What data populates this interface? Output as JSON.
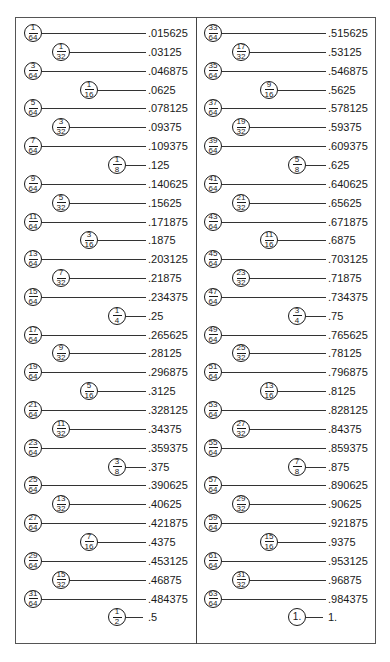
{
  "columns": [
    {
      "rows": [
        {
          "num": "1",
          "den": "64",
          "level": 64,
          "decimal": ".015625"
        },
        {
          "num": "1",
          "den": "32",
          "level": 32,
          "decimal": ".03125"
        },
        {
          "num": "3",
          "den": "64",
          "level": 64,
          "decimal": ".046875"
        },
        {
          "num": "1",
          "den": "16",
          "level": 16,
          "decimal": ".0625"
        },
        {
          "num": "5",
          "den": "64",
          "level": 64,
          "decimal": ".078125"
        },
        {
          "num": "3",
          "den": "32",
          "level": 32,
          "decimal": ".09375"
        },
        {
          "num": "7",
          "den": "64",
          "level": 64,
          "decimal": ".109375"
        },
        {
          "num": "1",
          "den": "8",
          "level": 8,
          "decimal": ".125"
        },
        {
          "num": "9",
          "den": "64",
          "level": 64,
          "decimal": ".140625"
        },
        {
          "num": "5",
          "den": "32",
          "level": 32,
          "decimal": ".15625"
        },
        {
          "num": "11",
          "den": "64",
          "level": 64,
          "decimal": ".171875"
        },
        {
          "num": "3",
          "den": "16",
          "level": 16,
          "decimal": ".1875"
        },
        {
          "num": "13",
          "den": "64",
          "level": 64,
          "decimal": ".203125"
        },
        {
          "num": "7",
          "den": "32",
          "level": 32,
          "decimal": ".21875"
        },
        {
          "num": "15",
          "den": "64",
          "level": 64,
          "decimal": ".234375"
        },
        {
          "num": "1",
          "den": "4",
          "level": 4,
          "decimal": ".25"
        },
        {
          "num": "17",
          "den": "64",
          "level": 64,
          "decimal": ".265625"
        },
        {
          "num": "9",
          "den": "32",
          "level": 32,
          "decimal": ".28125"
        },
        {
          "num": "19",
          "den": "64",
          "level": 64,
          "decimal": ".296875"
        },
        {
          "num": "5",
          "den": "16",
          "level": 16,
          "decimal": ".3125"
        },
        {
          "num": "21",
          "den": "64",
          "level": 64,
          "decimal": ".328125"
        },
        {
          "num": "11",
          "den": "32",
          "level": 32,
          "decimal": ".34375"
        },
        {
          "num": "23",
          "den": "64",
          "level": 64,
          "decimal": ".359375"
        },
        {
          "num": "3",
          "den": "8",
          "level": 8,
          "decimal": ".375"
        },
        {
          "num": "25",
          "den": "64",
          "level": 64,
          "decimal": ".390625"
        },
        {
          "num": "13",
          "den": "32",
          "level": 32,
          "decimal": ".40625"
        },
        {
          "num": "27",
          "den": "64",
          "level": 64,
          "decimal": ".421875"
        },
        {
          "num": "7",
          "den": "16",
          "level": 16,
          "decimal": ".4375"
        },
        {
          "num": "29",
          "den": "64",
          "level": 64,
          "decimal": ".453125"
        },
        {
          "num": "15",
          "den": "32",
          "level": 32,
          "decimal": ".46875"
        },
        {
          "num": "31",
          "den": "64",
          "level": 64,
          "decimal": ".484375"
        },
        {
          "num": "1",
          "den": "2",
          "level": 2,
          "decimal": ".5"
        }
      ]
    },
    {
      "rows": [
        {
          "num": "33",
          "den": "64",
          "level": 64,
          "decimal": ".515625"
        },
        {
          "num": "17",
          "den": "32",
          "level": 32,
          "decimal": ".53125"
        },
        {
          "num": "35",
          "den": "64",
          "level": 64,
          "decimal": ".546875"
        },
        {
          "num": "9",
          "den": "16",
          "level": 16,
          "decimal": ".5625"
        },
        {
          "num": "37",
          "den": "64",
          "level": 64,
          "decimal": ".578125"
        },
        {
          "num": "19",
          "den": "32",
          "level": 32,
          "decimal": ".59375"
        },
        {
          "num": "39",
          "den": "64",
          "level": 64,
          "decimal": ".609375"
        },
        {
          "num": "5",
          "den": "8",
          "level": 8,
          "decimal": ".625"
        },
        {
          "num": "41",
          "den": "64",
          "level": 64,
          "decimal": ".640625"
        },
        {
          "num": "21",
          "den": "32",
          "level": 32,
          "decimal": ".65625"
        },
        {
          "num": "43",
          "den": "64",
          "level": 64,
          "decimal": ".671875"
        },
        {
          "num": "11",
          "den": "16",
          "level": 16,
          "decimal": ".6875"
        },
        {
          "num": "45",
          "den": "64",
          "level": 64,
          "decimal": ".703125"
        },
        {
          "num": "23",
          "den": "32",
          "level": 32,
          "decimal": ".71875"
        },
        {
          "num": "47",
          "den": "64",
          "level": 64,
          "decimal": ".734375"
        },
        {
          "num": "3",
          "den": "4",
          "level": 4,
          "decimal": ".75"
        },
        {
          "num": "49",
          "den": "64",
          "level": 64,
          "decimal": ".765625"
        },
        {
          "num": "25",
          "den": "32",
          "level": 32,
          "decimal": ".78125"
        },
        {
          "num": "51",
          "den": "64",
          "level": 64,
          "decimal": ".796875"
        },
        {
          "num": "13",
          "den": "16",
          "level": 16,
          "decimal": ".8125"
        },
        {
          "num": "53",
          "den": "64",
          "level": 64,
          "decimal": ".828125"
        },
        {
          "num": "27",
          "den": "32",
          "level": 32,
          "decimal": ".84375"
        },
        {
          "num": "55",
          "den": "64",
          "level": 64,
          "decimal": ".859375"
        },
        {
          "num": "7",
          "den": "8",
          "level": 8,
          "decimal": ".875"
        },
        {
          "num": "57",
          "den": "64",
          "level": 64,
          "decimal": ".890625"
        },
        {
          "num": "29",
          "den": "32",
          "level": 32,
          "decimal": ".90625"
        },
        {
          "num": "59",
          "den": "64",
          "level": 64,
          "decimal": ".921875"
        },
        {
          "num": "15",
          "den": "16",
          "level": 16,
          "decimal": ".9375"
        },
        {
          "num": "61",
          "den": "64",
          "level": 64,
          "decimal": ".953125"
        },
        {
          "num": "31",
          "den": "32",
          "level": 32,
          "decimal": ".96875"
        },
        {
          "num": "63",
          "den": "64",
          "level": 64,
          "decimal": ".984375"
        },
        {
          "whole": "1.",
          "level": 1,
          "decimal": "1."
        }
      ]
    }
  ]
}
